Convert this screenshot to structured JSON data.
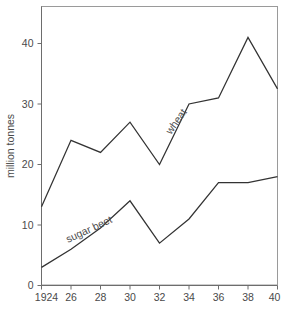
{
  "chart_data": {
    "type": "line",
    "title": "",
    "subtitle": "",
    "xlabel": "",
    "ylabel": "million tonnes",
    "x": [
      1924,
      26,
      28,
      30,
      32,
      34,
      36,
      38,
      40
    ],
    "x_tick_labels": [
      "1924",
      "26",
      "28",
      "30",
      "32",
      "34",
      "36",
      "38",
      "40"
    ],
    "y_tick_labels": [
      "0",
      "10",
      "20",
      "30",
      "40"
    ],
    "y_ticks": [
      0,
      10,
      20,
      30,
      40
    ],
    "xlim": [
      1924,
      40
    ],
    "ylim": [
      0,
      45
    ],
    "grid": false,
    "legend_position": "inline-annotation",
    "series": [
      {
        "name": "wheat",
        "label": "wheat",
        "color": "#333333",
        "values": [
          13,
          24,
          22,
          27,
          20,
          30,
          31,
          41,
          32.5
        ]
      },
      {
        "name": "sugar beet",
        "label": "sugar beet",
        "color": "#333333",
        "values": [
          3,
          6,
          9.5,
          14,
          7,
          11,
          17,
          17,
          18
        ]
      }
    ],
    "annotations": [
      {
        "text": "wheat",
        "series": "wheat",
        "rotation": -55
      },
      {
        "text": "sugar beet",
        "series": "sugar beet",
        "rotation": -25
      }
    ]
  },
  "colors": {
    "line": "#333333",
    "axis": "#6d6d6d",
    "frame": "#9a9a9a",
    "text": "#4a4a4a",
    "background": "#ffffff"
  }
}
